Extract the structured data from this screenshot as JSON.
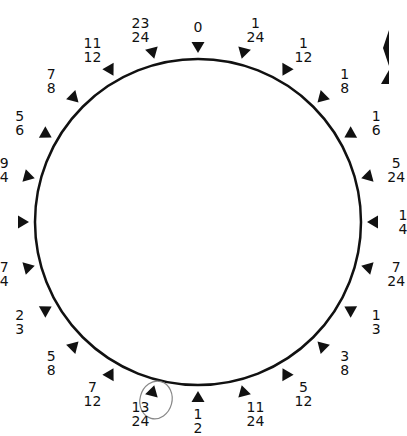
{
  "circle": {
    "cx": 198,
    "cy": 222,
    "r": 163,
    "stroke": "#111111"
  },
  "marks": [
    {
      "num": "0",
      "den": ""
    },
    {
      "num": "1",
      "den": "24"
    },
    {
      "num": "1",
      "den": "12"
    },
    {
      "num": "1",
      "den": "8"
    },
    {
      "num": "1",
      "den": "6"
    },
    {
      "num": "5",
      "den": "24"
    },
    {
      "num": "1",
      "den": "4"
    },
    {
      "num": "7",
      "den": "24"
    },
    {
      "num": "1",
      "den": "3"
    },
    {
      "num": "3",
      "den": "8"
    },
    {
      "num": "5",
      "den": "12"
    },
    {
      "num": "11",
      "den": "24"
    },
    {
      "num": "1",
      "den": "2"
    },
    {
      "num": "13",
      "den": "24",
      "circled": true
    },
    {
      "num": "7",
      "den": "12"
    },
    {
      "num": "5",
      "den": "8"
    },
    {
      "num": "2",
      "den": "3"
    },
    {
      "num": "17",
      "den": "24"
    },
    {
      "num": "3",
      "den": "4"
    },
    {
      "num": "19",
      "den": "24"
    },
    {
      "num": "5",
      "den": "6"
    },
    {
      "num": "7",
      "den": "8"
    },
    {
      "num": "11",
      "den": "12"
    },
    {
      "num": "23",
      "den": "24"
    }
  ]
}
